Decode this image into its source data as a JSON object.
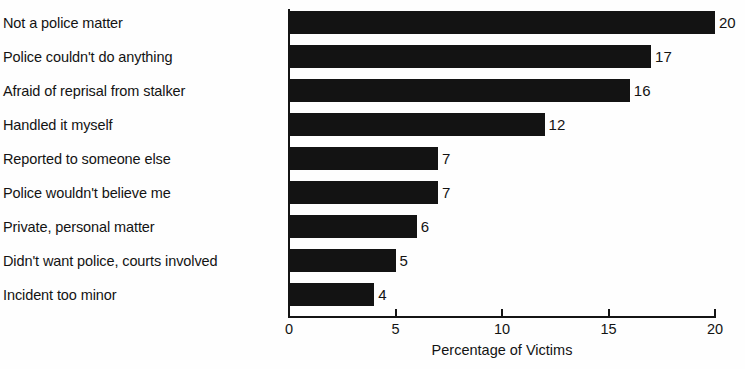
{
  "chart_data": {
    "type": "bar",
    "orientation": "horizontal",
    "title": "",
    "xlabel": "Percentage of Victims",
    "ylabel": "",
    "xlim": [
      0,
      20
    ],
    "xticks": [
      "0",
      "5",
      "10",
      "15",
      "20"
    ],
    "grid": false,
    "legend": false,
    "bar_color": "#131313",
    "axis_color": "#141414",
    "background_color": "#fefefe",
    "value_labels_shown": true,
    "categories": [
      "Not a police matter",
      "Police couldn't do anything",
      "Afraid of reprisal from stalker",
      "Handled it myself",
      "Reported to someone else",
      "Police wouldn't believe me",
      "Private, personal matter",
      "Didn't want police, courts involved",
      "Incident too minor"
    ],
    "values": [
      20,
      17,
      16,
      12,
      7,
      7,
      6,
      5,
      4
    ],
    "value_labels": [
      "20",
      "17",
      "16",
      "12",
      "7",
      "7",
      "6",
      "5",
      "4"
    ]
  }
}
